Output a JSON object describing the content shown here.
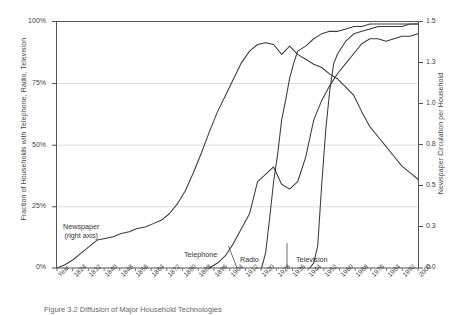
{
  "figure": {
    "caption": "Figure 3.2  Diffusion of Major Household Technologies"
  },
  "axes": {
    "left_title": "Fraction of Households with Telephone, Radio, Television",
    "right_title": "Newspaper Circulation per Household",
    "x_title": "Year",
    "left_ticks": [
      "100%",
      "75%",
      "50%",
      "25%",
      "0%"
    ],
    "right_ticks": [
      "1.5",
      "1.3",
      "1.0",
      "0.8",
      "0.5",
      "0.3",
      "0.0"
    ],
    "x_ticks": [
      "Year",
      "1824",
      "1832",
      "1840",
      "1848",
      "1856",
      "1864",
      "1872",
      "1880",
      "1888",
      "1896",
      "1904",
      "1912",
      "1920",
      "1928",
      "1936",
      "1944",
      "1952",
      "1960",
      "1968",
      "1976",
      "1984",
      "1992",
      "2000"
    ]
  },
  "series_labels": {
    "newspaper_main": "Newspaper",
    "newspaper_sub": "(right axis)",
    "telephone": "Telephone",
    "radio": "Radio",
    "television": "Television"
  },
  "style": {
    "line_color": "#3c3c3c",
    "grid_color": "#d9d9d9",
    "frame_color": "#555555"
  },
  "chart_data": {
    "type": "line",
    "title": "",
    "xlabel": "Year",
    "ylabel": "Fraction of Households with Telephone, Radio, Television",
    "y2label": "Newspaper Circulation per Household",
    "xlim": [
      1820,
      2000
    ],
    "ylim": [
      0,
      100
    ],
    "y2lim": [
      0.0,
      1.5
    ],
    "grid": true,
    "legend": "inline-annotations",
    "series": [
      {
        "name": "Newspaper",
        "axis": "right",
        "units": "circulation per household",
        "x": [
          1820,
          1824,
          1828,
          1832,
          1836,
          1840,
          1844,
          1848,
          1852,
          1856,
          1860,
          1864,
          1868,
          1872,
          1876,
          1880,
          1884,
          1888,
          1892,
          1896,
          1900,
          1904,
          1908,
          1912,
          1916,
          1920,
          1924,
          1928,
          1932,
          1936,
          1940,
          1944,
          1948,
          1952,
          1956,
          1960,
          1964,
          1968,
          1972,
          1976,
          1980,
          1984,
          1988,
          1992,
          1996,
          2000
        ],
        "values": [
          0.0,
          0.02,
          0.05,
          0.09,
          0.13,
          0.17,
          0.18,
          0.19,
          0.21,
          0.22,
          0.24,
          0.25,
          0.27,
          0.29,
          0.33,
          0.39,
          0.47,
          0.58,
          0.7,
          0.83,
          0.95,
          1.05,
          1.15,
          1.25,
          1.32,
          1.36,
          1.37,
          1.36,
          1.3,
          1.35,
          1.3,
          1.27,
          1.24,
          1.22,
          1.18,
          1.15,
          1.1,
          1.05,
          0.95,
          0.86,
          0.8,
          0.74,
          0.68,
          0.62,
          0.58,
          0.54
        ]
      },
      {
        "name": "Telephone",
        "axis": "left",
        "units": "percent of households",
        "x": [
          1896,
          1900,
          1904,
          1908,
          1912,
          1916,
          1920,
          1924,
          1928,
          1932,
          1936,
          1940,
          1944,
          1948,
          1952,
          1956,
          1960,
          1964,
          1968,
          1972,
          1976,
          1980,
          1984,
          1988,
          1992,
          1996,
          2000
        ],
        "values": [
          0.0,
          2.0,
          5.0,
          10.0,
          16.0,
          22.0,
          35.0,
          38.0,
          41.0,
          34.0,
          32.0,
          35.0,
          45.0,
          60.0,
          68.0,
          74.0,
          79.0,
          83.0,
          87.0,
          91.0,
          93.0,
          93.0,
          92.0,
          93.0,
          94.0,
          94.0,
          95.0
        ]
      },
      {
        "name": "Radio",
        "axis": "left",
        "units": "percent of households",
        "x": [
          1922,
          1924,
          1926,
          1928,
          1930,
          1932,
          1934,
          1936,
          1938,
          1940,
          1944,
          1948,
          1952,
          1956,
          1960,
          1964,
          1968,
          1972,
          1976,
          1980,
          1984,
          1988,
          1992,
          1996,
          2000
        ],
        "values": [
          0.0,
          6.0,
          20.0,
          35.0,
          46.0,
          60.0,
          68.0,
          77.0,
          83.0,
          88.0,
          90.0,
          93.0,
          95.0,
          96.0,
          96.0,
          97.0,
          98.0,
          98.0,
          99.0,
          99.0,
          99.0,
          99.0,
          99.0,
          99.0,
          99.0
        ]
      },
      {
        "name": "Television",
        "axis": "left",
        "units": "percent of households",
        "x": [
          1946,
          1948,
          1950,
          1952,
          1954,
          1956,
          1958,
          1960,
          1964,
          1968,
          1972,
          1976,
          1980,
          1984,
          1988,
          1992,
          1996,
          2000
        ],
        "values": [
          0.0,
          2.0,
          9.0,
          34.0,
          56.0,
          72.0,
          83.0,
          87.0,
          92.0,
          95.0,
          96.0,
          97.0,
          98.0,
          98.0,
          98.0,
          98.0,
          99.0,
          99.0
        ]
      }
    ]
  }
}
